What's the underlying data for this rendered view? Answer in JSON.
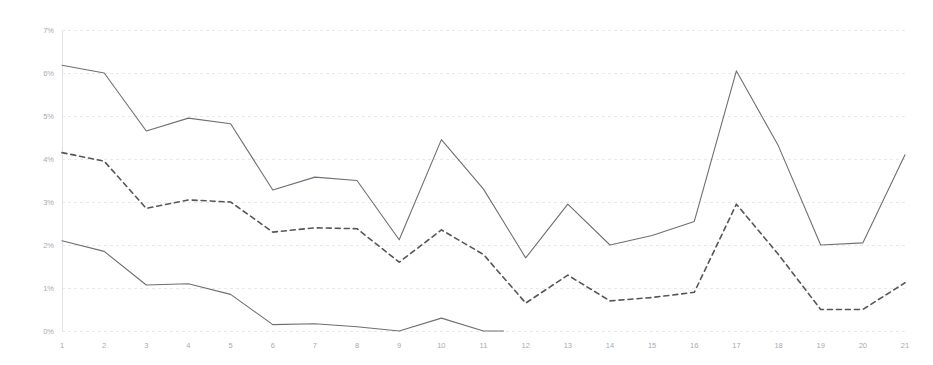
{
  "chart_data": {
    "type": "line",
    "title": "",
    "subtitle": "",
    "xlabel": "",
    "ylabel": "",
    "grid": true,
    "legend": "none",
    "x": [
      1,
      2,
      3,
      4,
      5,
      6,
      7,
      8,
      9,
      10,
      11,
      12,
      13,
      14,
      15,
      16,
      17,
      18,
      19,
      20,
      21
    ],
    "categories": [
      "1",
      "2",
      "3",
      "4",
      "5",
      "6",
      "7",
      "8",
      "9",
      "10",
      "11",
      "12",
      "13",
      "14",
      "15",
      "16",
      "17",
      "18",
      "19",
      "20",
      "21"
    ],
    "xlim": [
      1,
      21
    ],
    "ylim": [
      0,
      7
    ],
    "y_ticks": [
      0,
      1,
      2,
      3,
      4,
      5,
      6,
      7
    ],
    "y_tick_labels": [
      "0%",
      "1%",
      "2%",
      "3%",
      "4%",
      "5%",
      "6%",
      "7%"
    ],
    "x_tick_labels": [
      "1",
      "2",
      "3",
      "4",
      "5",
      "6",
      "7",
      "8",
      "9",
      "10",
      "11",
      "12",
      "13",
      "14",
      "15",
      "16",
      "17",
      "18",
      "19",
      "20",
      "21"
    ],
    "value_unit": "%",
    "series": [
      {
        "name": "upper-bound",
        "style": "solid",
        "color": "#6e6e76",
        "values": [
          6.18,
          6.0,
          4.65,
          4.95,
          4.82,
          3.28,
          3.58,
          3.5,
          2.12,
          4.45,
          3.3,
          1.7,
          2.95,
          2.0,
          2.22,
          2.55,
          6.05,
          4.3,
          2.0,
          2.05,
          4.1
        ]
      },
      {
        "name": "median",
        "style": "dashed",
        "color": "#55555d",
        "values": [
          4.15,
          3.95,
          2.85,
          3.05,
          3.0,
          2.3,
          2.4,
          2.38,
          1.6,
          2.35,
          1.78,
          0.65,
          1.3,
          0.7,
          0.78,
          0.9,
          2.95,
          1.78,
          0.5,
          0.5,
          1.12
        ]
      },
      {
        "name": "lower-bound",
        "style": "solid",
        "color": "#6e6e76",
        "values": [
          2.1,
          1.85,
          1.07,
          1.1,
          0.85,
          0.15,
          0.17,
          0.1,
          0.0,
          0.3,
          0.0,
          null,
          null,
          null,
          null,
          null,
          null,
          null,
          null,
          null,
          null
        ]
      }
    ],
    "notes": {
      "lower_bound_gap": "lower-bound series terminates at 0% near x=8.5 and reappears as a small bump between x=9.5 and x=10.5"
    }
  },
  "axes": {
    "plot_left": 62,
    "plot_right": 905,
    "plot_top": 30,
    "plot_bottom": 331
  }
}
